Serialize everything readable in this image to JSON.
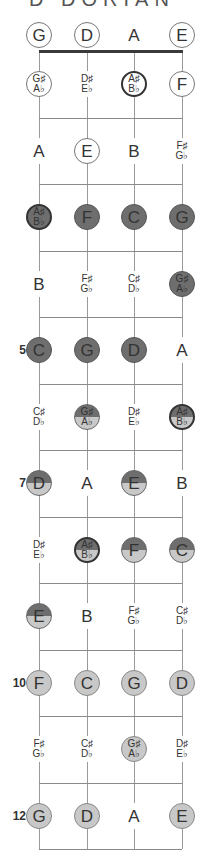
{
  "title": "D DORIAN",
  "strings": [
    "G",
    "D",
    "A",
    "E"
  ],
  "colors": {
    "dark": "#6e6e6e",
    "light": "#c8c8c8",
    "outline": "#777777",
    "nut": "#3a3a3a"
  },
  "fret_markers": [
    {
      "fret": 5,
      "label": "5"
    },
    {
      "fret": 7,
      "label": "7"
    },
    {
      "fret": 10,
      "label": "10"
    },
    {
      "fret": 12,
      "label": "12"
    }
  ],
  "rows": [
    {
      "fret": 0,
      "notes": [
        {
          "l1": "G",
          "style": "outline"
        },
        {
          "l1": "D",
          "style": "outline"
        },
        {
          "l1": "A",
          "style": "plain"
        },
        {
          "l1": "E",
          "style": "outline"
        }
      ]
    },
    {
      "fret": 1,
      "notes": [
        {
          "l1": "G♯",
          "l2": "A♭",
          "style": "outline"
        },
        {
          "l1": "D♯",
          "l2": "E♭",
          "style": "plain"
        },
        {
          "l1": "A♯",
          "l2": "B♭",
          "style": "bold"
        },
        {
          "l1": "F",
          "style": "outline"
        }
      ]
    },
    {
      "fret": 2,
      "notes": [
        {
          "l1": "A",
          "style": "plain"
        },
        {
          "l1": "E",
          "style": "outline"
        },
        {
          "l1": "B",
          "style": "plain"
        },
        {
          "l1": "F♯",
          "l2": "G♭",
          "style": "plain"
        }
      ]
    },
    {
      "fret": 3,
      "notes": [
        {
          "l1": "A♯",
          "l2": "B♭",
          "style": "dark bold"
        },
        {
          "l1": "F",
          "style": "dark"
        },
        {
          "l1": "C",
          "style": "dark"
        },
        {
          "l1": "G",
          "style": "dark"
        }
      ]
    },
    {
      "fret": 4,
      "notes": [
        {
          "l1": "B",
          "style": "plain"
        },
        {
          "l1": "F♯",
          "l2": "G♭",
          "style": "plain"
        },
        {
          "l1": "C♯",
          "l2": "D♭",
          "style": "plain"
        },
        {
          "l1": "G♯",
          "l2": "A♭",
          "style": "dark"
        }
      ]
    },
    {
      "fret": 5,
      "notes": [
        {
          "l1": "C",
          "style": "dark"
        },
        {
          "l1": "G",
          "style": "dark"
        },
        {
          "l1": "D",
          "style": "dark"
        },
        {
          "l1": "A",
          "style": "plain"
        }
      ]
    },
    {
      "fret": 6,
      "notes": [
        {
          "l1": "C♯",
          "l2": "D♭",
          "style": "plain"
        },
        {
          "l1": "G♯",
          "l2": "A♭",
          "style": "split"
        },
        {
          "l1": "D♯",
          "l2": "E♭",
          "style": "plain"
        },
        {
          "l1": "A♯",
          "l2": "B♭",
          "style": "split bold"
        }
      ]
    },
    {
      "fret": 7,
      "notes": [
        {
          "l1": "D",
          "style": "split"
        },
        {
          "l1": "A",
          "style": "plain"
        },
        {
          "l1": "E",
          "style": "split"
        },
        {
          "l1": "B",
          "style": "plain"
        }
      ]
    },
    {
      "fret": 8,
      "notes": [
        {
          "l1": "D♯",
          "l2": "E♭",
          "style": "plain"
        },
        {
          "l1": "A♯",
          "l2": "B♭",
          "style": "split bold"
        },
        {
          "l1": "F",
          "style": "split"
        },
        {
          "l1": "C",
          "style": "split"
        }
      ]
    },
    {
      "fret": 9,
      "notes": [
        {
          "l1": "E",
          "style": "split"
        },
        {
          "l1": "B",
          "style": "plain"
        },
        {
          "l1": "F♯",
          "l2": "G♭",
          "style": "plain"
        },
        {
          "l1": "C♯",
          "l2": "D♭",
          "style": "plain"
        }
      ]
    },
    {
      "fret": 10,
      "notes": [
        {
          "l1": "F",
          "style": "light"
        },
        {
          "l1": "C",
          "style": "light"
        },
        {
          "l1": "G",
          "style": "light"
        },
        {
          "l1": "D",
          "style": "light"
        }
      ]
    },
    {
      "fret": 11,
      "notes": [
        {
          "l1": "F♯",
          "l2": "G♭",
          "style": "plain"
        },
        {
          "l1": "C♯",
          "l2": "D♭",
          "style": "plain"
        },
        {
          "l1": "G♯",
          "l2": "A♭",
          "style": "light"
        },
        {
          "l1": "D♯",
          "l2": "E♭",
          "style": "plain"
        }
      ]
    },
    {
      "fret": 12,
      "notes": [
        {
          "l1": "G",
          "style": "light"
        },
        {
          "l1": "D",
          "style": "light"
        },
        {
          "l1": "A",
          "style": "plain"
        },
        {
          "l1": "E",
          "style": "light"
        }
      ]
    }
  ]
}
